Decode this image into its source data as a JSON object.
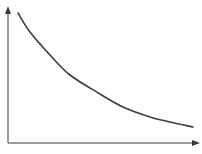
{
  "diagram": {
    "type": "decay-curve",
    "axes": {
      "x_label": "",
      "y_label": "",
      "has_arrows": true,
      "color": "#7a7a7a"
    },
    "curve": {
      "color": "#3e3e3e",
      "shape": "exponential-decay",
      "points_px": [
        [
          18,
          13
        ],
        [
          30,
          32
        ],
        [
          50,
          55
        ],
        [
          70,
          75
        ],
        [
          100,
          94
        ],
        [
          123,
          107
        ],
        [
          150,
          117
        ],
        [
          170,
          122
        ],
        [
          193,
          127
        ]
      ]
    },
    "background": "#ffffff"
  }
}
